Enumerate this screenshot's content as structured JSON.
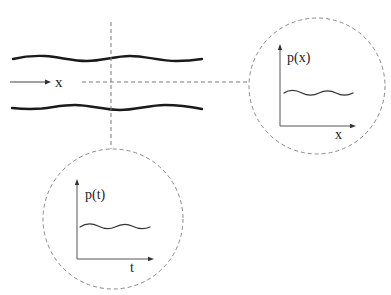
{
  "diagram": {
    "type": "pipe-flow-pressure-probe",
    "pipe": {
      "flow_direction_label": "x",
      "walls": [
        "top-wall",
        "bottom-wall"
      ]
    },
    "insets": [
      {
        "id": "spatial",
        "y_label": "p(x)",
        "x_label": "x",
        "signal": "wavy pressure vs position"
      },
      {
        "id": "temporal",
        "y_label": "p(t)",
        "x_label": "t",
        "signal": "wavy pressure vs time"
      }
    ],
    "colors": {
      "wall": "#1a1a1a",
      "dashed": "#7a7a7a",
      "axis": "#555555",
      "background": "#ffffff"
    }
  }
}
